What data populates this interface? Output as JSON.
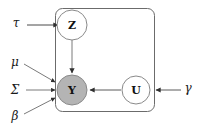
{
  "diagram": {
    "type": "plate-notation-graphical-model",
    "title": "",
    "background_color": "#ffffff",
    "stroke_color": "#6b6b6b",
    "arrow_color": "#3a3a3a",
    "observed_fill": "#b4b4b4",
    "latent_fill": "#ffffff",
    "nodes": [
      {
        "id": "Z",
        "label": "Z",
        "kind": "latent",
        "shape": "circle",
        "fill": "#ffffff",
        "cx": 72,
        "cy": 25,
        "r": 15
      },
      {
        "id": "Y",
        "label": "Y",
        "kind": "observed",
        "shape": "circle",
        "fill": "#b4b4b4",
        "cx": 72,
        "cy": 90,
        "r": 15
      },
      {
        "id": "U",
        "label": "U",
        "kind": "latent",
        "shape": "circle",
        "fill": "#ffffff",
        "cx": 136,
        "cy": 90,
        "r": 14
      }
    ],
    "parameters": [
      {
        "id": "tau",
        "label": "τ",
        "x": 16,
        "y": 23,
        "target": "Z"
      },
      {
        "id": "mu",
        "label": "μ",
        "x": 15,
        "y": 62,
        "target": "Y"
      },
      {
        "id": "sigma",
        "label": "Σ",
        "x": 15,
        "y": 90,
        "target": "Y"
      },
      {
        "id": "beta",
        "label": "β",
        "x": 15,
        "y": 116,
        "target": "Y"
      },
      {
        "id": "gamma",
        "label": "γ",
        "x": 188,
        "y": 88,
        "target": "U"
      }
    ],
    "edges": [
      {
        "from": "tau",
        "to": "Z",
        "style": "solid",
        "arrow": true
      },
      {
        "from": "Z",
        "to": "Y",
        "style": "solid",
        "arrow": true
      },
      {
        "from": "mu",
        "to": "Y",
        "style": "solid",
        "arrow": true
      },
      {
        "from": "sigma",
        "to": "Y",
        "style": "solid",
        "arrow": true
      },
      {
        "from": "beta",
        "to": "Y",
        "style": "solid",
        "arrow": true
      },
      {
        "from": "U",
        "to": "Y",
        "style": "solid",
        "arrow": true
      },
      {
        "from": "gamma",
        "to": "U",
        "style": "solid",
        "arrow": true
      }
    ],
    "plate": {
      "id": "plate-1",
      "label": "",
      "x": 55,
      "y": 8,
      "width": 100,
      "height": 104,
      "corner_radius": 7,
      "stroke": "#6b6b6b"
    }
  }
}
